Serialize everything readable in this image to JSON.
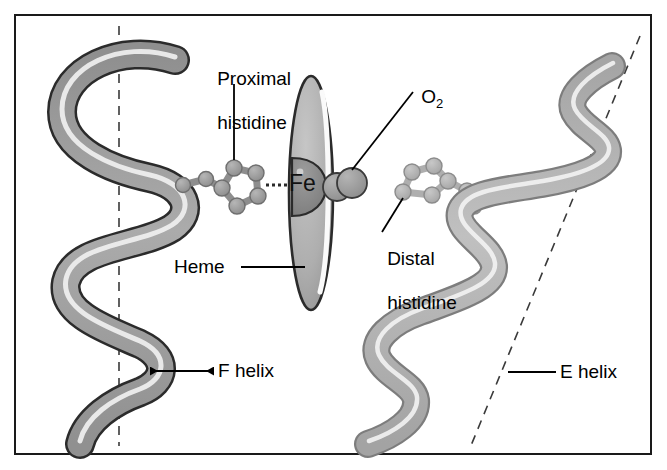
{
  "figure": {
    "border_color": "#1a1a1a",
    "background": "#ffffff"
  },
  "labels": {
    "proximal_histidine_line1": "Proximal",
    "proximal_histidine_line2": "histidine",
    "oxygen": "O",
    "oxygen_subscript": "2",
    "heme": "Heme",
    "distal_histidine_line1": "Distal",
    "distal_histidine_line2": "histidine",
    "f_helix": "F helix",
    "e_helix": "E helix",
    "iron": "Fe"
  },
  "colors": {
    "ribbon_fill_f": "#a9a9a9",
    "ribbon_fill_e": "#b9b9b9",
    "ribbon_outline": "#2b2b2b",
    "ribbon_highlight": "#f2f2f2",
    "heme_fill": "#b0b0b0",
    "heme_outline": "#2b2b2b",
    "iron_fill": "#8a8a8a",
    "iron_outline": "#2b2b2b",
    "atom_fill_proximal": "#9a9a9a",
    "atom_fill_distal": "#b4b4b4",
    "oxygen_fill": "#9e9e9e",
    "axis_dash": "#3a3a3a",
    "leader": "#000000",
    "text": "#000000"
  },
  "elements": {
    "f_helix_axis": "vertical dashed axis",
    "e_helix_axis": "diagonal dashed axis",
    "fe_bond": "dotted coordination bond",
    "o2_spheres": 2,
    "imidazole_ring_atoms": 5
  }
}
